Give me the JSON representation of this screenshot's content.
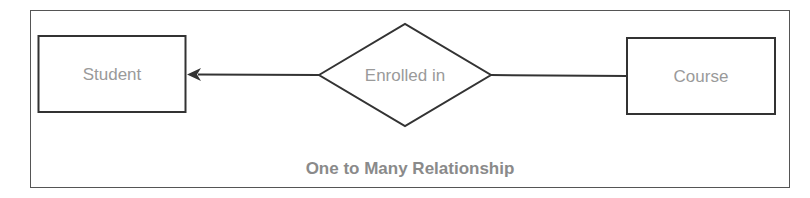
{
  "diagram": {
    "type": "ER diagram",
    "caption": "One to Many Relationship",
    "entities": [
      {
        "id": "student",
        "label": "Student"
      },
      {
        "id": "course",
        "label": "Course"
      }
    ],
    "relationship": {
      "label": "Enrolled in",
      "from": "course",
      "to": "student",
      "arrow_head_at": "student"
    },
    "colors": {
      "stroke": "#333333",
      "text": "#9a9a9a",
      "caption": "#8a8a8a",
      "frame": "#555555"
    }
  }
}
